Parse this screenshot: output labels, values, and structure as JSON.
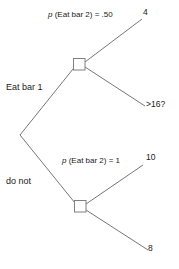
{
  "diagram": {
    "type": "decision-tree",
    "background_color": "#ffffff",
    "line_color": "#555555",
    "text_color": "#1a1a1a",
    "node_fill": "#ffffff",
    "nodes": [
      {
        "id": "root",
        "shape": "vertex",
        "x": 20,
        "y": 135
      },
      {
        "id": "upper-decision-node",
        "shape": "square",
        "x": 79,
        "y": 64
      },
      {
        "id": "lower-decision-node",
        "shape": "square",
        "x": 80,
        "y": 206
      }
    ],
    "labels": {
      "prob_top_prefix": "p",
      "prob_top_rest": " (Eat bar 2) = .50",
      "prob_top_full": "p (Eat bar 2) = .50",
      "payoff_top": "4",
      "branch_upper": "Eat bar 1",
      "outcome_middle": ">16?",
      "prob_bottom_prefix": "p",
      "prob_bottom_rest": " (Eat bar 2) = 1",
      "prob_bottom_full": "p (Eat bar 2) = 1",
      "payoff_upper_lower": "10",
      "branch_lower": "do not",
      "payoff_bottom": "8"
    }
  }
}
